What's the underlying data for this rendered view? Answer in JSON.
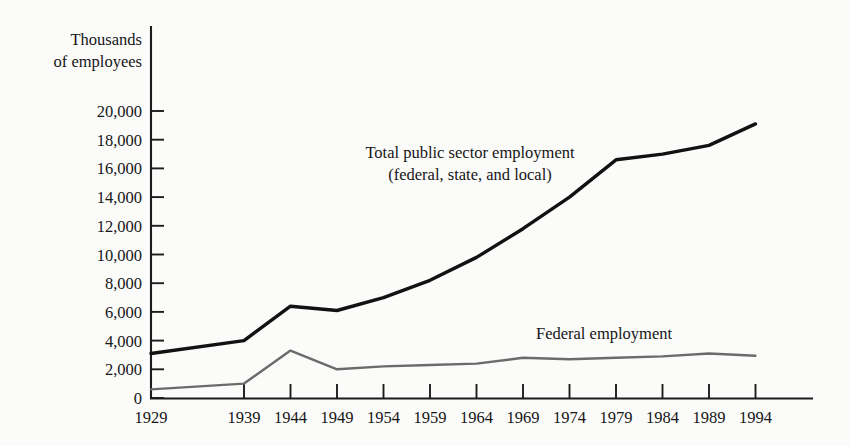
{
  "chart_data": {
    "type": "line",
    "title": "",
    "xlabel": "",
    "ylabel": "Thousands of employees",
    "ylabel_line1": "Thousands",
    "ylabel_line2": "of employees",
    "grid": false,
    "legend_position": "inline-annotation",
    "xlim": [
      1929,
      1994
    ],
    "ylim": [
      0,
      20000
    ],
    "ytick_step": 2000,
    "categories": [
      1929,
      1939,
      1944,
      1949,
      1954,
      1959,
      1964,
      1969,
      1974,
      1979,
      1984,
      1989,
      1994
    ],
    "xtick_labels": [
      "1929",
      "1939",
      "1944",
      "1949",
      "1954",
      "1959",
      "1964",
      "1969",
      "1974",
      "1979",
      "1984",
      "1989",
      "1994"
    ],
    "ytick_labels": [
      "20,000",
      "18,000",
      "16,000",
      "14,000",
      "12,000",
      "10,000",
      "8,000",
      "6,000",
      "4,000",
      "2,000",
      "0"
    ],
    "ytick_values": [
      20000,
      18000,
      16000,
      14000,
      12000,
      10000,
      8000,
      6000,
      4000,
      2000,
      0
    ],
    "series": [
      {
        "name": "Total public sector employment (federal, state, and local)",
        "label_line1": "Total public sector employment",
        "label_line2": "(federal, state, and local)",
        "color": "#121212",
        "values": [
          3100,
          4000,
          6400,
          6100,
          7000,
          8200,
          9800,
          11800,
          14000,
          16600,
          17000,
          17600,
          19100
        ]
      },
      {
        "name": "Federal employment",
        "label_line1": "Federal employment",
        "label_line2": "",
        "color": "#6b6b6b",
        "values": [
          600,
          1000,
          3300,
          2000,
          2200,
          2300,
          2400,
          2800,
          2700,
          2800,
          2900,
          3100,
          2950
        ]
      }
    ],
    "annotations": [
      {
        "text": "Total public sector employment",
        "x": 1959,
        "y": 15600
      },
      {
        "text": "(federal, state, and local)",
        "x": 1959,
        "y": 14300
      },
      {
        "text": "Federal employment",
        "x": 1976,
        "y": 5300
      }
    ]
  }
}
